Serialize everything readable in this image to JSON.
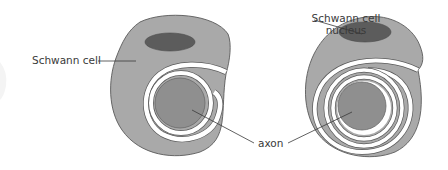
{
  "colors": {
    "cytoplasm": "#a9a9a9",
    "nucleus": "#5c5c5c",
    "axon": "#8f8f8f",
    "outline": "#5a5a5a",
    "label_text": "#3a3a3a",
    "background": "#ffffff"
  },
  "panels": [
    {
      "id": "early-wrapping",
      "labels": {
        "schwann_cell": "Schwann cell"
      },
      "wrap_turns": 2
    },
    {
      "id": "later-wrapping",
      "labels": {
        "nucleus_line1": "Schwann cell",
        "nucleus_line2": "nucleus"
      },
      "wrap_turns": 3
    }
  ],
  "shared_labels": {
    "axon": "axon"
  }
}
